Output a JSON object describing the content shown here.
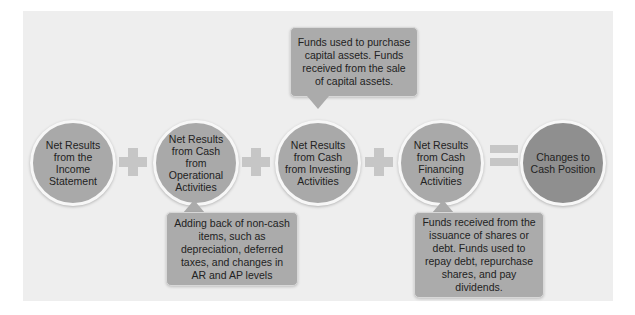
{
  "diagram": {
    "nodes": [
      {
        "id": "income",
        "label": "Net Results from the Income Statement"
      },
      {
        "id": "operating",
        "label": "Net Results from Cash from Operational Activities"
      },
      {
        "id": "investing",
        "label": "Net Results from Cash from Investing Activities"
      },
      {
        "id": "financing",
        "label": "Net Results from Cash Financing Activities"
      },
      {
        "id": "result",
        "label": "Changes to Cash Position"
      }
    ],
    "operators": [
      "+",
      "+",
      "+",
      "="
    ],
    "callouts": {
      "operating": "Adding back of non-cash items, such as depreciation, deferred taxes, and changes in AR and AP levels",
      "investing": "Funds used to purchase capital assets. Funds received from the sale of capital assets.",
      "financing": "Funds received from the issuance of shares or debt. Funds used to repay debt, repurchase shares, and pay dividends."
    },
    "colors": {
      "panel": "#eeeeee",
      "circle": "#a9a9a9",
      "circle_final": "#8f8f8f",
      "operator": "#c6c6c6",
      "callout": "#ababab"
    }
  }
}
